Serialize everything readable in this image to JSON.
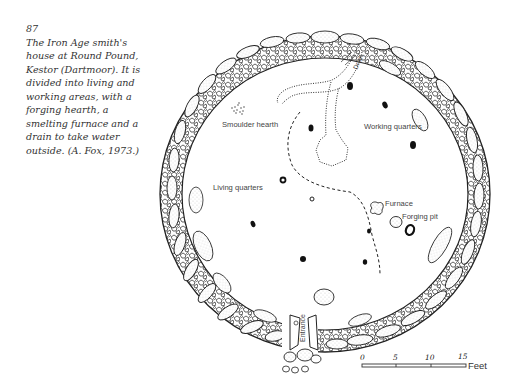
{
  "caption": {
    "figure_number": "87",
    "text": "The Iron Age smith's house at Round Pound, Kestor (Dartmoor). It is divided into living and working areas, with a forging hearth, a smelting furnace and a drain to take water outside. (A. Fox, 1973.)"
  },
  "plan": {
    "labels": {
      "smoulder_hearth": "Smoulder hearth",
      "working_quarters": "Working quarters",
      "living_quarters": "Living quarters",
      "furnace": "Furnace",
      "forging_pit": "Forging pit",
      "drain": "Drain",
      "entrance": "Entrance"
    },
    "scale": {
      "ticks": [
        "0",
        "5",
        "10",
        "15"
      ],
      "unit": "Feet"
    }
  }
}
